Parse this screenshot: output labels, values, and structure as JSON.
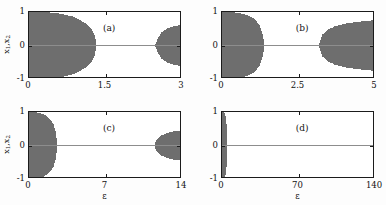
{
  "figure": {
    "background_color": "#fdfdfd",
    "axis_color": "#1b1b1b",
    "data_color": "#6e6e6e",
    "zero_line_color": "#8d8d8d"
  },
  "chart_data": [
    {
      "type": "area",
      "panel_label": "(a)",
      "xlabel": "",
      "ylabel": "x₁,x₂",
      "xlim": [
        0,
        3
      ],
      "ylim": [
        -1,
        1
      ],
      "xticks": [
        0,
        1.5,
        3
      ],
      "xticklabels": [
        "0",
        "1.5",
        "3"
      ],
      "yticks": [
        -1,
        0,
        1
      ],
      "yticklabels": [
        "-1",
        "0",
        "1"
      ],
      "grid": false,
      "legend": "none",
      "description": "Bifurcation/synchronization diagram: chaotic desynchronized band occupies |x|<=envelope for small epsilon, collapses to x=0 synchronized state, then reopens near epsilon=2.5.",
      "series": [
        {
          "name": "left-chaotic-envelope",
          "x": [
            0,
            0.15,
            0.35,
            0.6,
            0.85,
            1.0,
            1.12,
            1.2,
            1.27,
            1.3
          ],
          "envelope": [
            1.0,
            1.0,
            0.99,
            0.95,
            0.86,
            0.75,
            0.62,
            0.5,
            0.3,
            0.0
          ]
        },
        {
          "name": "right-chaotic-envelope",
          "x": [
            2.47,
            2.52,
            2.6,
            2.72,
            2.85,
            3.0
          ],
          "envelope": [
            0.0,
            0.22,
            0.4,
            0.52,
            0.58,
            0.62
          ]
        },
        {
          "name": "synchronized-state",
          "x": [
            1.3,
            3.0
          ],
          "envelope": [
            0.0,
            0.0
          ]
        }
      ]
    },
    {
      "type": "area",
      "panel_label": "(b)",
      "xlabel": "",
      "ylabel": "",
      "xlim": [
        0,
        5
      ],
      "ylim": [
        -1,
        1
      ],
      "xticks": [
        0,
        2.5,
        5
      ],
      "xticklabels": [
        "0",
        "2.5",
        "5"
      ],
      "yticks": [
        -1,
        0,
        1
      ],
      "yticklabels": [
        "-1",
        "0",
        "1"
      ],
      "grid": false,
      "legend": "none",
      "description": "Chaotic band collapses near epsilon=1.35 and reopens near epsilon=3.2, widening to about +/-0.75 at epsilon=5.",
      "series": [
        {
          "name": "left-chaotic-envelope",
          "x": [
            0,
            0.2,
            0.45,
            0.7,
            0.95,
            1.1,
            1.22,
            1.3,
            1.35
          ],
          "envelope": [
            1.0,
            1.0,
            0.98,
            0.93,
            0.84,
            0.72,
            0.55,
            0.32,
            0.0
          ]
        },
        {
          "name": "right-chaotic-envelope",
          "x": [
            3.15,
            3.25,
            3.45,
            3.7,
            4.0,
            4.35,
            4.7,
            5.0
          ],
          "envelope": [
            0.0,
            0.3,
            0.47,
            0.58,
            0.65,
            0.7,
            0.73,
            0.76
          ]
        },
        {
          "name": "synchronized-state",
          "x": [
            1.35,
            5.0
          ],
          "envelope": [
            0.0,
            0.0
          ]
        }
      ]
    },
    {
      "type": "area",
      "panel_label": "(c)",
      "xlabel": "ε",
      "ylabel": "x₁,x₂",
      "xlim": [
        0,
        14
      ],
      "ylim": [
        -1,
        1
      ],
      "xticks": [
        0,
        7,
        14
      ],
      "xticklabels": [
        "0",
        "7",
        "14"
      ],
      "yticks": [
        -1,
        0,
        1
      ],
      "yticklabels": [
        "-1",
        "0",
        "1"
      ],
      "grid": false,
      "legend": "none",
      "description": "Chaotic band collapses near epsilon=2.5 and reopens near epsilon=11.5, reaching about +/-0.45 at epsilon=14.",
      "series": [
        {
          "name": "left-chaotic-envelope",
          "x": [
            0,
            0.4,
            0.9,
            1.4,
            1.85,
            2.15,
            2.35,
            2.5
          ],
          "envelope": [
            1.0,
            1.0,
            0.97,
            0.9,
            0.78,
            0.62,
            0.4,
            0.0
          ]
        },
        {
          "name": "right-chaotic-envelope",
          "x": [
            11.4,
            11.7,
            12.1,
            12.6,
            13.2,
            14.0
          ],
          "envelope": [
            0.0,
            0.2,
            0.3,
            0.37,
            0.42,
            0.46
          ]
        },
        {
          "name": "synchronized-state",
          "x": [
            2.5,
            14.0
          ],
          "envelope": [
            0.0,
            0.0
          ]
        }
      ]
    },
    {
      "type": "area",
      "panel_label": "(d)",
      "xlabel": "ε",
      "ylabel": "",
      "xlim": [
        0,
        140
      ],
      "ylim": [
        -1,
        1
      ],
      "xticks": [
        0,
        70,
        140
      ],
      "xticklabels": [
        "0",
        "70",
        "140"
      ],
      "yticks": [
        -1,
        0,
        1
      ],
      "yticklabels": [
        "-1",
        "0",
        "1"
      ],
      "grid": false,
      "legend": "none",
      "description": "Very narrow chaotic band near epsilon=0 collapsing by epsilon=4; synchronized state across the range; a thin desynchronized stripe at the right boundary epsilon=140.",
      "series": [
        {
          "name": "left-chaotic-envelope",
          "x": [
            0,
            1.0,
            2.0,
            3.0,
            3.6,
            4.0
          ],
          "envelope": [
            1.0,
            1.0,
            0.92,
            0.7,
            0.4,
            0.0
          ]
        },
        {
          "name": "right-edge-stripe",
          "x": [
            138.5,
            140.0
          ],
          "envelope": [
            1.0,
            1.0
          ]
        },
        {
          "name": "synchronized-state",
          "x": [
            4.0,
            140.0
          ],
          "envelope": [
            0.0,
            0.0
          ]
        }
      ]
    }
  ]
}
